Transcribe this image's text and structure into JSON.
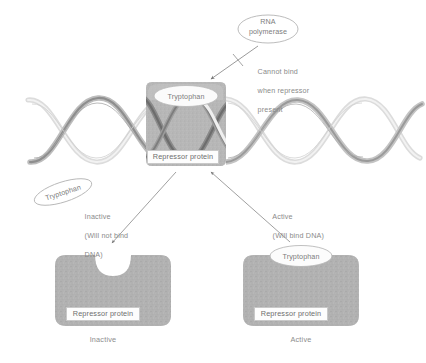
{
  "figure": {
    "colors": {
      "protein_fill": "#b4b4b4",
      "protein_fill_dark": "#a8a8a8",
      "dna_strand_light": "#d6d6d6",
      "dna_strand_dark": "#8c8c8c",
      "dna_strand_darkest": "#6a6a6a",
      "text": "#8a8a8a",
      "label_border": "#c9c9c9",
      "background": "#ffffff"
    }
  },
  "top_panel": {
    "rna_polymerase": {
      "label": "RNA\npolymerase",
      "line1": "RNA",
      "line2": "polymerase"
    },
    "blocked_note": {
      "line1": "Cannot bind",
      "line2": "when repressor",
      "line3": "present"
    },
    "bound_complex": {
      "tryptophan_label": "Tryptophan",
      "repressor_label": "Repressor protein"
    },
    "dna": {
      "name": "dna-double-helix"
    }
  },
  "middle_panel": {
    "free_tryptophan_label": "Tryptophan",
    "left_note": {
      "line1": "Inactive",
      "line2": "(Will not bind",
      "line3": "DNA)"
    },
    "right_note": {
      "line1": "Active",
      "line2": "(Will bind DNA)"
    }
  },
  "bottom_panel": {
    "inactive_protein": {
      "repressor_label": "Repressor protein",
      "caption": "Inactive",
      "notch": "empty-binding-site"
    },
    "active_protein": {
      "tryptophan_label": "Tryptophan",
      "repressor_label": "Repressor protein",
      "caption": "Active"
    }
  }
}
